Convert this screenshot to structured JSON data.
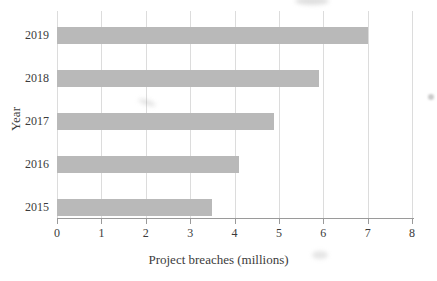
{
  "chart_data": {
    "type": "bar",
    "orientation": "horizontal",
    "title": "",
    "categories": [
      "2019",
      "2018",
      "2017",
      "2016",
      "2015"
    ],
    "values": [
      7.0,
      5.9,
      4.9,
      4.1,
      3.5
    ],
    "xlabel": "Project breaches (millions)",
    "ylabel": "Year",
    "xlim": [
      0,
      8
    ],
    "xticks": [
      "0",
      "1",
      "2",
      "3",
      "4",
      "5",
      "6",
      "7",
      "8"
    ],
    "grid": true,
    "legend": false,
    "colors": {
      "bar": "#b9b9b9",
      "gridline": "#dcdcdc",
      "axis": "#9a9a9a",
      "text": "#3b3b3b",
      "background": "#ffffff"
    }
  }
}
